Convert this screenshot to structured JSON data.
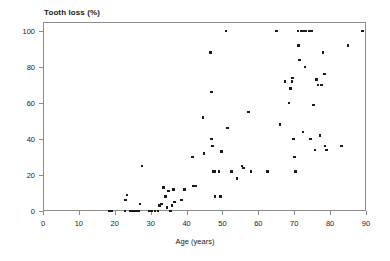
{
  "chart_data": {
    "type": "scatter",
    "title": "Tooth loss (%)",
    "xlabel": "Age (years)",
    "ylabel": "Tooth loss (%)",
    "xlim": [
      0,
      90
    ],
    "ylim": [
      0,
      105
    ],
    "xticks": [
      0,
      10,
      20,
      30,
      40,
      50,
      60,
      70,
      80,
      90
    ],
    "yticks": [
      0,
      20,
      40,
      60,
      80,
      100
    ],
    "grid": false,
    "legend": null,
    "marker": "filled-square",
    "marker_color": "#1a1a1a",
    "series": [
      {
        "name": "Subjects",
        "points": [
          [
            18.6,
            0
          ],
          [
            19.2,
            0
          ],
          [
            22.8,
            0
          ],
          [
            23.0,
            6
          ],
          [
            23.4,
            9
          ],
          [
            24.4,
            0
          ],
          [
            25.2,
            0
          ],
          [
            25.9,
            0
          ],
          [
            26.6,
            0
          ],
          [
            27.0,
            4
          ],
          [
            27.6,
            25
          ],
          [
            29.6,
            0
          ],
          [
            30.4,
            0
          ],
          [
            31.2,
            0
          ],
          [
            32.0,
            0
          ],
          [
            32.5,
            3
          ],
          [
            33.0,
            4
          ],
          [
            33.5,
            13
          ],
          [
            34.2,
            8
          ],
          [
            34.6,
            2
          ],
          [
            35.0,
            11
          ],
          [
            35.6,
            0
          ],
          [
            35.9,
            3
          ],
          [
            36.4,
            12
          ],
          [
            36.6,
            5
          ],
          [
            38.6,
            6
          ],
          [
            39.4,
            12
          ],
          [
            41.6,
            30
          ],
          [
            42.0,
            14
          ],
          [
            42.6,
            14
          ],
          [
            44.6,
            52
          ],
          [
            44.9,
            32
          ],
          [
            46.6,
            88
          ],
          [
            46.9,
            66
          ],
          [
            47.0,
            40
          ],
          [
            47.2,
            36
          ],
          [
            47.4,
            22
          ],
          [
            47.8,
            22
          ],
          [
            47.9,
            8
          ],
          [
            49.0,
            22
          ],
          [
            49.4,
            8
          ],
          [
            49.8,
            33
          ],
          [
            51.0,
            100
          ],
          [
            51.4,
            46
          ],
          [
            52.6,
            22
          ],
          [
            54.0,
            18
          ],
          [
            55.4,
            25
          ],
          [
            55.8,
            24
          ],
          [
            57.2,
            55
          ],
          [
            58.0,
            22
          ],
          [
            62.6,
            22
          ],
          [
            65.0,
            100
          ],
          [
            66.0,
            48
          ],
          [
            67.4,
            72
          ],
          [
            68.6,
            60
          ],
          [
            69.0,
            68
          ],
          [
            69.4,
            72
          ],
          [
            69.6,
            74
          ],
          [
            69.8,
            40
          ],
          [
            70.1,
            30
          ],
          [
            70.3,
            22
          ],
          [
            71.0,
            100
          ],
          [
            71.2,
            92
          ],
          [
            71.4,
            84
          ],
          [
            72.0,
            100
          ],
          [
            72.4,
            100
          ],
          [
            72.8,
            100
          ],
          [
            73.2,
            100
          ],
          [
            73.0,
            80
          ],
          [
            72.5,
            44
          ],
          [
            74.2,
            100
          ],
          [
            74.6,
            40
          ],
          [
            75.0,
            100
          ],
          [
            75.4,
            59
          ],
          [
            75.8,
            34
          ],
          [
            76.2,
            73
          ],
          [
            76.6,
            70
          ],
          [
            77.2,
            42
          ],
          [
            77.6,
            70
          ],
          [
            78.0,
            88
          ],
          [
            78.4,
            76
          ],
          [
            78.6,
            36
          ],
          [
            79.0,
            34
          ],
          [
            83.2,
            36
          ],
          [
            85.0,
            92
          ],
          [
            89.0,
            100
          ]
        ]
      }
    ]
  }
}
